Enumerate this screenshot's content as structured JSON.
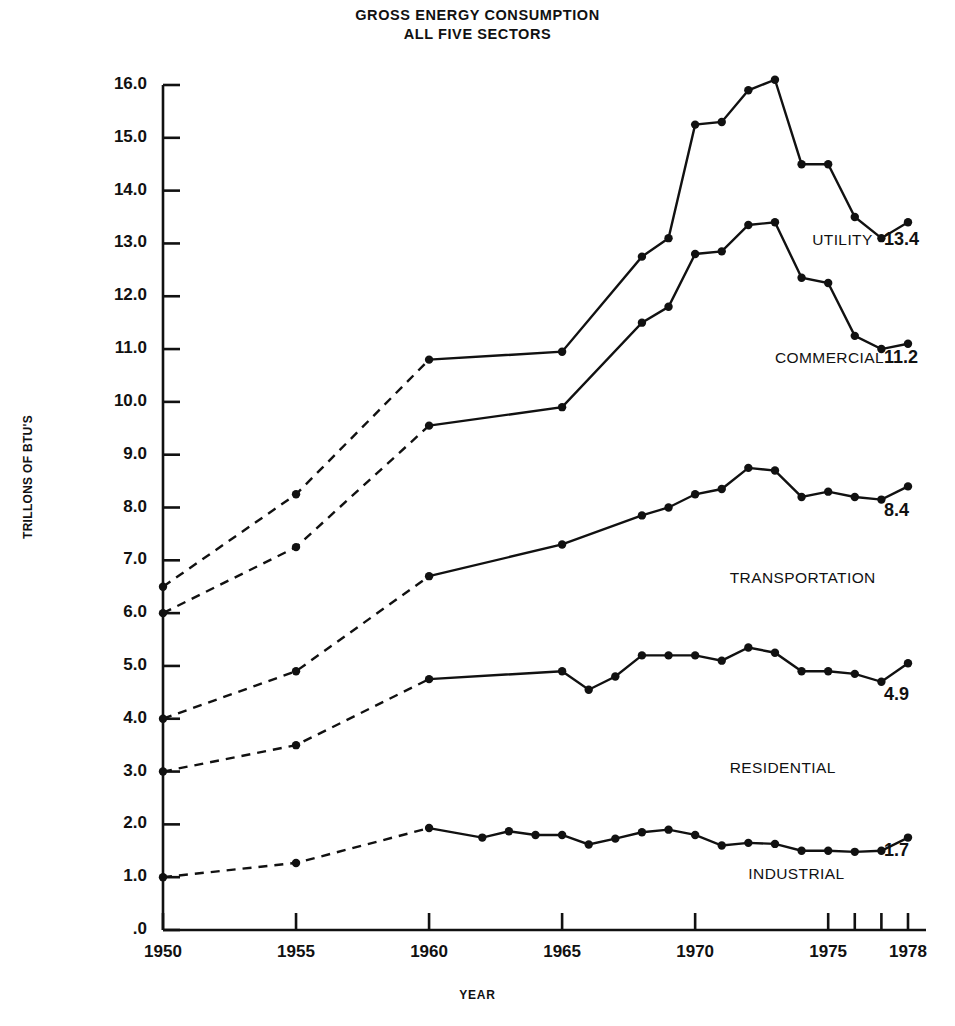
{
  "title": {
    "line1": "GROSS ENERGY CONSUMPTION",
    "line2": "ALL FIVE SECTORS"
  },
  "axes": {
    "ylabel": "TRILLONS OF BTU'S",
    "xlabel": "YEAR"
  },
  "chart_data": {
    "type": "line",
    "title": "GROSS ENERGY CONSUMPTION ALL FIVE SECTORS",
    "xlabel": "YEAR",
    "ylabel": "TRILLONS OF BTU'S",
    "xlim": [
      1950,
      1978
    ],
    "ylim": [
      0,
      16
    ],
    "grid": false,
    "legend_position": "inline-right",
    "x_tick_labels": [
      "1950",
      "1955",
      "1960",
      "1965",
      "1970",
      "1975",
      "1978"
    ],
    "x_tick_values": [
      1950,
      1955,
      1960,
      1965,
      1970,
      1975,
      1978
    ],
    "x_minor_ticks": [
      1976,
      1977
    ],
    "y_tick_labels": [
      ".0",
      "1.0",
      "2.0",
      "3.0",
      "4.0",
      "5.0",
      "6.0",
      "7.0",
      "8.0",
      "9.0",
      "10.0",
      "11.0",
      "12.0",
      "13.0",
      "14.0",
      "15.0",
      "16.0"
    ],
    "y_tick_values": [
      0,
      1,
      2,
      3,
      4,
      5,
      6,
      7,
      8,
      9,
      10,
      11,
      12,
      13,
      14,
      15,
      16
    ],
    "series": [
      {
        "name": "UTILITY",
        "label": "UTILITY",
        "end_value_label": "13.4",
        "label_x": 1974.4,
        "label_y": 13.05,
        "value_x": 1977.1,
        "value_y": 13.05,
        "dashed_until": 1960,
        "x": [
          1950,
          1955,
          1960,
          1965,
          1968,
          1969,
          1970,
          1971,
          1972,
          1973,
          1974,
          1975,
          1976,
          1977,
          1978
        ],
        "y": [
          6.5,
          8.25,
          10.8,
          10.95,
          12.75,
          13.1,
          15.25,
          15.3,
          15.9,
          16.1,
          14.5,
          14.5,
          13.5,
          13.1,
          13.4
        ]
      },
      {
        "name": "COMMERCIAL",
        "label": "COMMERCIAL",
        "end_value_label": "11.2",
        "label_x": 1973.0,
        "label_y": 10.82,
        "value_x": 1977.1,
        "value_y": 10.82,
        "dashed_until": 1960,
        "x": [
          1950,
          1955,
          1960,
          1965,
          1968,
          1969,
          1970,
          1971,
          1972,
          1973,
          1974,
          1975,
          1976,
          1977,
          1978
        ],
        "y": [
          6.0,
          7.25,
          9.55,
          9.9,
          11.5,
          11.8,
          12.8,
          12.85,
          13.35,
          13.4,
          12.35,
          12.25,
          11.25,
          11.0,
          11.1
        ]
      },
      {
        "name": "TRANSPORTATION",
        "label": "TRANSPORTATION",
        "end_value_label": "8.4",
        "label_x": 1971.3,
        "label_y": 6.65,
        "value_x": 1977.1,
        "value_y": 7.92,
        "dashed_until": 1960,
        "x": [
          1950,
          1955,
          1960,
          1965,
          1968,
          1969,
          1970,
          1971,
          1972,
          1973,
          1974,
          1975,
          1976,
          1977,
          1978
        ],
        "y": [
          4.0,
          4.9,
          6.7,
          7.3,
          7.85,
          8.0,
          8.25,
          8.35,
          8.75,
          8.7,
          8.2,
          8.3,
          8.2,
          8.15,
          8.4
        ]
      },
      {
        "name": "RESIDENTIAL",
        "label": "RESIDENTIAL",
        "end_value_label": "4.9",
        "label_x": 1971.3,
        "label_y": 3.05,
        "value_x": 1977.1,
        "value_y": 4.43,
        "dashed_until": 1960,
        "x": [
          1950,
          1955,
          1960,
          1965,
          1966,
          1967,
          1968,
          1969,
          1970,
          1971,
          1972,
          1973,
          1974,
          1975,
          1976,
          1977,
          1978
        ],
        "y": [
          3.0,
          3.5,
          4.75,
          4.9,
          4.55,
          4.8,
          5.2,
          5.2,
          5.2,
          5.1,
          5.35,
          5.25,
          4.9,
          4.9,
          4.85,
          4.7,
          5.05
        ]
      },
      {
        "name": "INDUSTRIAL",
        "label": "INDUSTRIAL",
        "end_value_label": "1.7",
        "label_x": 1972.0,
        "label_y": 1.05,
        "value_x": 1977.1,
        "value_y": 1.47,
        "dashed_until": 1960,
        "x": [
          1950,
          1955,
          1960,
          1962,
          1963,
          1964,
          1965,
          1966,
          1967,
          1968,
          1969,
          1970,
          1971,
          1972,
          1973,
          1974,
          1975,
          1976,
          1977,
          1978
        ],
        "y": [
          1.0,
          1.27,
          1.93,
          1.75,
          1.87,
          1.8,
          1.8,
          1.62,
          1.73,
          1.85,
          1.9,
          1.8,
          1.6,
          1.65,
          1.63,
          1.5,
          1.5,
          1.48,
          1.5,
          1.75
        ]
      }
    ]
  }
}
